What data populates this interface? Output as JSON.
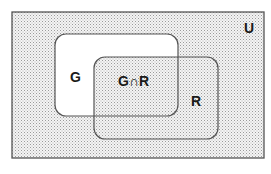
{
  "diagram": {
    "type": "venn",
    "universe": {
      "label": "U",
      "fill": "stippled"
    },
    "sets": [
      {
        "id": "G",
        "label": "G"
      },
      {
        "id": "R",
        "label": "R"
      }
    ],
    "intersection": {
      "label": "G∩R"
    },
    "colors": {
      "border": "#555555",
      "stipple_dot": "#9a9a9a",
      "stipple_bg": "#f4f4f4",
      "g_only_fill": "#ffffff",
      "text": "#1a1a1a"
    }
  }
}
